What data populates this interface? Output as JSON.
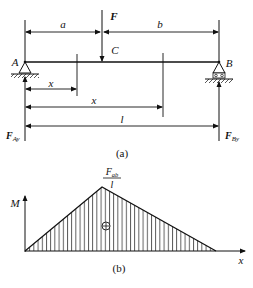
{
  "figure_a": {
    "caption": "(a)",
    "force_label": "F",
    "point_c_label": "C",
    "support_a_label": "A",
    "support_b_label": "B",
    "dim_a_label": "a",
    "dim_b_label": "b",
    "dim_x1_label": "x",
    "dim_x2_label": "x",
    "dim_l_label": "l",
    "reaction_a_label": "F",
    "reaction_a_sub": "Ay",
    "reaction_b_label": "F",
    "reaction_b_sub": "By"
  },
  "figure_b": {
    "caption": "(b)",
    "y_axis_label": "M",
    "x_axis_label": "x",
    "peak_numerator": "F",
    "peak_numerator_sub": "ab",
    "peak_denominator": "l",
    "sign_symbol": "⊕"
  }
}
